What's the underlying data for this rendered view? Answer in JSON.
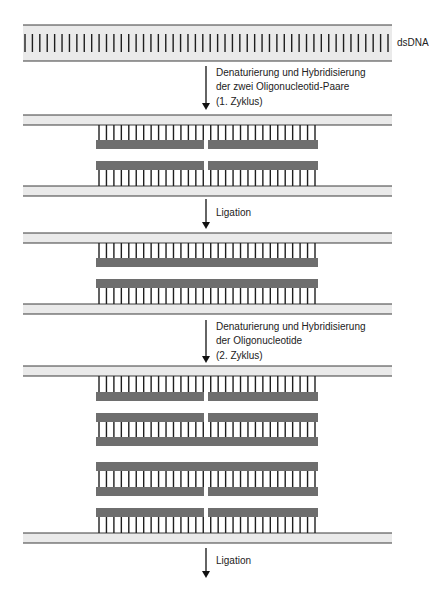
{
  "colors": {
    "strand_fill": "#eaeaea",
    "strand_line": "#3a3a3a",
    "tick": "#1e1e1e",
    "oligo": "#6e6e6e",
    "text": "#222222"
  },
  "geometry": {
    "strand_x0": 23,
    "strand_x1": 392,
    "oligo_x0": 96,
    "oligo_x1": 318,
    "gap_x0": 204,
    "gap_x1": 208,
    "tick_spacing": 7.4
  },
  "label_dsDNA": "dsDNA",
  "steps": [
    {
      "y0": 66,
      "y1": 110,
      "lines": [
        "Denaturierung und Hybridisierung",
        "der zwei Oligonucleotid-Paare",
        "(1. Zyklus)"
      ],
      "text_y": 66
    },
    {
      "y0": 199,
      "y1": 229,
      "lines": [
        "Ligation"
      ],
      "text_y": 206
    },
    {
      "y0": 320,
      "y1": 363,
      "lines": [
        "Denaturierung und Hybridisierung",
        "der Oligonucleotide",
        "(2. Zyklus)"
      ],
      "text_y": 320
    },
    {
      "y0": 548,
      "y1": 578,
      "lines": [
        "Ligation"
      ],
      "text_y": 554
    }
  ],
  "stages": [
    {
      "name": "dsdna",
      "strands": [
        {
          "y": 25,
          "h": 36
        }
      ],
      "full_ticks": [
        {
          "y0": 34,
          "y1": 52
        }
      ],
      "oligos": [],
      "oligo_ticks": []
    },
    {
      "name": "cycle-1-hybridized",
      "strands": [
        {
          "y": 115,
          "h": 10
        },
        {
          "y": 186,
          "h": 10
        }
      ],
      "full_ticks": [],
      "oligos": [
        {
          "y": 140,
          "split": true
        },
        {
          "y": 161,
          "split": true
        }
      ],
      "oligo_ticks": [
        {
          "y0": 125,
          "y1": 140
        },
        {
          "y0": 170,
          "y1": 186
        }
      ]
    },
    {
      "name": "ligated-1",
      "strands": [
        {
          "y": 233,
          "h": 10
        },
        {
          "y": 304,
          "h": 10
        }
      ],
      "full_ticks": [],
      "oligos": [
        {
          "y": 258,
          "split": false
        },
        {
          "y": 279,
          "split": false
        }
      ],
      "oligo_ticks": [
        {
          "y0": 243,
          "y1": 258
        },
        {
          "y0": 288,
          "y1": 304
        }
      ]
    },
    {
      "name": "cycle-2-hybridized",
      "strands": [
        {
          "y": 366,
          "h": 10
        },
        {
          "y": 533,
          "h": 10
        }
      ],
      "full_ticks": [],
      "oligos": [
        {
          "y": 392,
          "split": true
        },
        {
          "y": 413,
          "split": true
        },
        {
          "y": 437,
          "split": false
        },
        {
          "y": 462,
          "split": false
        },
        {
          "y": 487,
          "split": true
        },
        {
          "y": 508,
          "split": true
        }
      ],
      "oligo_ticks": [
        {
          "y0": 376,
          "y1": 392
        },
        {
          "y0": 422,
          "y1": 437
        },
        {
          "y0": 471,
          "y1": 487
        },
        {
          "y0": 517,
          "y1": 533
        }
      ]
    }
  ]
}
